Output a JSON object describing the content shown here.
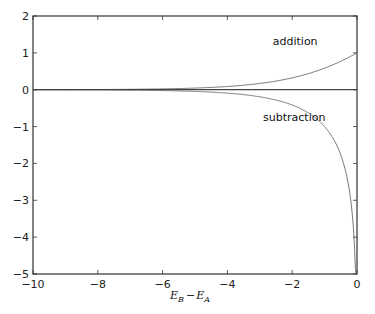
{
  "chart_data": {
    "type": "line",
    "title": "",
    "xlabel": "E_B - E_A",
    "xlabel_parts": {
      "main1": "E",
      "sub1": "B",
      "op": "−",
      "main2": "E",
      "sub2": "A"
    },
    "ylabel": "",
    "xlim": [
      -10,
      0
    ],
    "ylim": [
      -5,
      2
    ],
    "grid": false,
    "legend": null,
    "x_ticks": [
      -10,
      -8,
      -6,
      -4,
      -2,
      0
    ],
    "x_tick_labels": [
      "−10",
      "−8",
      "−6",
      "−4",
      "−2",
      "0"
    ],
    "y_ticks": [
      2,
      1,
      0,
      -1,
      -2,
      -3,
      -4,
      -5
    ],
    "y_tick_labels": [
      "2",
      "1",
      "0",
      "−1",
      "−2",
      "−3",
      "−4",
      "−5"
    ],
    "annotations": [
      {
        "text": "addition",
        "x": -2.6,
        "y": 1.2
      },
      {
        "text": "subtraction",
        "x": -2.9,
        "y": -0.85
      }
    ],
    "series": [
      {
        "name": "addition",
        "formula": "log2(1 + 2^x)",
        "x": [
          -10,
          -8,
          -6,
          -5,
          -4,
          -3,
          -2,
          -1.5,
          -1,
          -0.5,
          0
        ],
        "values": [
          0.0014,
          0.0056,
          0.0221,
          0.0444,
          0.0875,
          0.1699,
          0.3219,
          0.4427,
          0.585,
          0.7716,
          1.0
        ]
      },
      {
        "name": "subtraction",
        "formula": "log2(1 - 2^x)",
        "x": [
          -10,
          -8,
          -6,
          -5,
          -4,
          -3,
          -2,
          -1.5,
          -1,
          -0.5,
          -0.25,
          -0.1,
          -0.05,
          -0.03
        ],
        "values": [
          -0.0014,
          -0.0056,
          -0.0228,
          -0.0458,
          -0.0931,
          -0.1926,
          -0.415,
          -0.6458,
          -1.0,
          -1.7716,
          -2.5324,
          -3.858,
          -4.8466,
          -5.0
        ]
      },
      {
        "name": "zero-line",
        "x": [
          -10,
          0
        ],
        "values": [
          0,
          0
        ]
      }
    ]
  },
  "colors": {
    "axes": "#333333",
    "curve": "#777777",
    "zero_line": "#444444"
  }
}
